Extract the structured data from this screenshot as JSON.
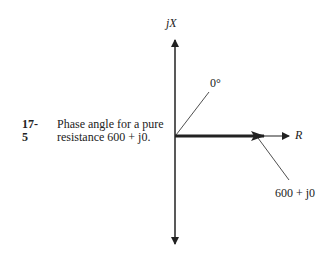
{
  "figure": {
    "number": "17-5",
    "caption_line1": "Phase angle for a pure",
    "caption_line2": "resistance 600 + j0."
  },
  "diagram": {
    "vertical_axis_label": "jX",
    "horizontal_axis_label": "R",
    "angle_label": "0°",
    "vector_label": "600 + j0",
    "colors": {
      "ink": "#222222",
      "background": "#ffffff"
    }
  }
}
